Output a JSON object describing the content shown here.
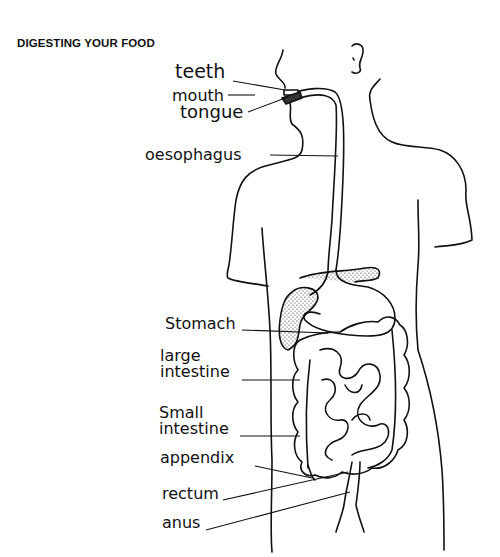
{
  "title": "DIGESTING YOUR FOOD",
  "labels": {
    "teeth": "teeth",
    "mouth": "mouth",
    "tongue": "tongue",
    "oesophagus": "oesophagus",
    "stomach": "Stomach",
    "large_intestine_1": "large",
    "large_intestine_2": "intestine",
    "small_intestine_1": "Small",
    "small_intestine_2": "intestine",
    "appendix": "appendix",
    "rectum": "rectum",
    "anus": "anus"
  },
  "colors": {
    "ink": "#111111",
    "background": "#ffffff"
  }
}
